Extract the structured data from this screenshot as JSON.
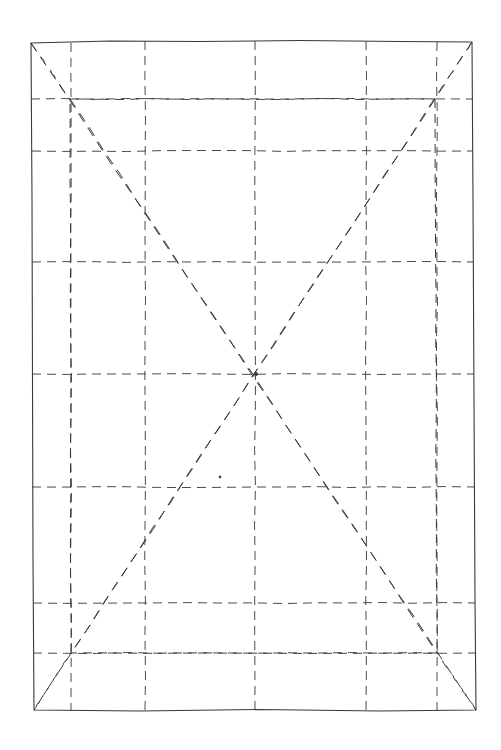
{
  "document": {
    "title": "Geometric Grid Construction Drawing",
    "background_color": "#ffffff",
    "width": 501,
    "height": 750
  },
  "style": {
    "ink_color": "#4a4a4a",
    "ink_color_dark": "#3a3a3a",
    "outer_frame_stroke_width": 1.1,
    "grid_stroke_width": 1.0,
    "diagonal_stroke_width": 1.0,
    "grid_dash_pattern": "9 6",
    "diagonal_dash_pattern": "10 7"
  },
  "figure": {
    "type": "line-drawing",
    "outer_frame": {
      "label": "outer-frame",
      "style": "solid",
      "corners": {
        "top_left": {
          "x": 31,
          "y": 43
        },
        "top_right": {
          "x": 472,
          "y": 42
        },
        "bottom_right": {
          "x": 476,
          "y": 710
        },
        "bottom_left": {
          "x": 34,
          "y": 710
        }
      },
      "path": "M31,43 L110,41 L200,41.5 L300,40.5 L400,41.5 L472,42 L473,200 L474,400 L475,600 L476,710 L380,711 L260,709.5 L140,711 L34,710 L33,560 L32.5,380 L32,200 Z"
    },
    "inner_frame": {
      "label": "inner-frame",
      "style": "dashed",
      "corners": {
        "top_left": {
          "x": 70,
          "y": 99
        },
        "top_right": {
          "x": 435,
          "y": 99
        },
        "bottom_right": {
          "x": 437,
          "y": 653
        },
        "bottom_left": {
          "x": 71,
          "y": 653
        }
      }
    },
    "vertical_grid_lines": [
      {
        "label": "v-inner-left",
        "x": 71,
        "y1": 43,
        "y2": 710
      },
      {
        "label": "v-quarter-left",
        "x": 145,
        "y1": 41,
        "y2": 711
      },
      {
        "label": "v-center",
        "x": 255,
        "y1": 41,
        "y2": 710
      },
      {
        "label": "v-quarter-right",
        "x": 366,
        "y1": 41,
        "y2": 711
      },
      {
        "label": "v-inner-right",
        "x": 437,
        "y1": 42,
        "y2": 710
      }
    ],
    "horizontal_grid_lines": [
      {
        "label": "h-inner-top",
        "y": 99,
        "x1": 31,
        "x2": 473
      },
      {
        "label": "h-second",
        "y": 151,
        "x1": 32,
        "x2": 473
      },
      {
        "label": "h-third",
        "y": 262,
        "x1": 32,
        "x2": 474
      },
      {
        "label": "h-center",
        "y": 374,
        "x1": 32,
        "x2": 474
      },
      {
        "label": "h-fifth",
        "y": 487,
        "x1": 32,
        "x2": 475
      },
      {
        "label": "h-sixth",
        "y": 603,
        "x1": 33,
        "x2": 475
      },
      {
        "label": "h-inner-bottom",
        "y": 653,
        "x1": 33,
        "x2": 476
      }
    ],
    "center_point": {
      "label": "center-convergence-point",
      "x": 256,
      "y": 374
    },
    "diagonals": [
      {
        "label": "diag-outer-tl-br",
        "x1": 31,
        "y1": 43,
        "x2": 476,
        "y2": 710
      },
      {
        "label": "diag-outer-tr-bl",
        "x1": 472,
        "y1": 42,
        "x2": 34,
        "y2": 710
      },
      {
        "label": "diag-inner-tl-br",
        "x1": 70,
        "y1": 99,
        "x2": 437,
        "y2": 653
      },
      {
        "label": "diag-inner-tr-bl",
        "x1": 435,
        "y1": 99,
        "x2": 71,
        "y2": 653
      },
      {
        "label": "diag-tl-corner-to-inner",
        "x1": 31,
        "y1": 43,
        "x2": 70,
        "y2": 99
      },
      {
        "label": "diag-tr-corner-to-inner",
        "x1": 472,
        "y1": 42,
        "x2": 435,
        "y2": 99
      },
      {
        "label": "diag-bl-corner-to-inner",
        "x1": 34,
        "y1": 710,
        "x2": 71,
        "y2": 653
      },
      {
        "label": "diag-br-corner-to-inner",
        "x1": 476,
        "y1": 710,
        "x2": 437,
        "y2": 653
      }
    ],
    "marks": [
      {
        "label": "isolated-dot",
        "x": 220,
        "y": 477,
        "radius": 1.4
      }
    ]
  }
}
